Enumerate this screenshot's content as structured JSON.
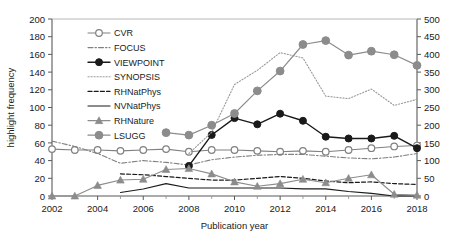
{
  "chart_data": {
    "type": "line",
    "title": "",
    "xlabel": "Publication year",
    "ylabel": "highlight frequency",
    "y2label": "",
    "xlim": [
      2002,
      2018
    ],
    "ylim": [
      0,
      200
    ],
    "y2lim": [
      0,
      500
    ],
    "grid": false,
    "legend_position": "inside-top-left",
    "xticks": [
      "2002",
      "2004",
      "2006",
      "2008",
      "2010",
      "2012",
      "2014",
      "2016",
      "2018"
    ],
    "yticks": [
      "0",
      "20",
      "40",
      "60",
      "80",
      "100",
      "120",
      "140",
      "160",
      "180",
      "200"
    ],
    "y2ticks": [
      "0",
      "50",
      "100",
      "150",
      "200",
      "250",
      "300",
      "350",
      "400",
      "450",
      "500"
    ],
    "x": [
      2002,
      2003,
      2004,
      2005,
      2006,
      2007,
      2008,
      2009,
      2010,
      2011,
      2012,
      2013,
      2014,
      2015,
      2016,
      2017,
      2018
    ],
    "series": [
      {
        "name": "CVR",
        "axis": "left",
        "style": "solid-open-circle",
        "color": "#808080",
        "values": [
          53,
          52,
          52,
          51,
          52,
          53,
          50,
          52,
          52,
          51,
          50,
          51,
          50,
          52,
          54,
          56,
          57
        ]
      },
      {
        "name": "FOCUS",
        "axis": "left",
        "style": "dash-dot",
        "color": "#808080",
        "values": [
          62,
          56,
          48,
          37,
          40,
          38,
          35,
          41,
          44,
          46,
          47,
          47,
          45,
          43,
          42,
          44,
          48
        ]
      },
      {
        "name": "VIEWPOINT",
        "axis": "left",
        "style": "solid-filled-circle",
        "color": "#1a1a1a",
        "values": [
          null,
          null,
          null,
          null,
          null,
          null,
          34,
          69,
          88,
          81,
          93,
          85,
          67,
          65,
          65,
          68,
          54
        ]
      },
      {
        "name": "SYNOPSIS",
        "axis": "right",
        "style": "dotted",
        "color": "#9a9a9a",
        "values": [
          null,
          null,
          null,
          null,
          null,
          null,
          120,
          180,
          315,
          355,
          405,
          390,
          282,
          275,
          302,
          256,
          273
        ]
      },
      {
        "name": "RHNatPhys",
        "axis": "left",
        "style": "dashed",
        "color": "#1a1a1a",
        "values": [
          null,
          null,
          null,
          25,
          24,
          22,
          20,
          18,
          18,
          20,
          22,
          20,
          17,
          15,
          16,
          14,
          13
        ]
      },
      {
        "name": "NVNatPhys",
        "axis": "left",
        "style": "solid-thin",
        "color": "#1a1a1a",
        "values": [
          null,
          null,
          null,
          4,
          8,
          14,
          9,
          9,
          9,
          9,
          9,
          8,
          8,
          5,
          3,
          0,
          0
        ]
      },
      {
        "name": "RHNature",
        "axis": "left",
        "style": "solid-triangle",
        "color": "#8c8c8c",
        "values": [
          0,
          0,
          12,
          18,
          19,
          30,
          31,
          25,
          16,
          11,
          14,
          19,
          15,
          20,
          24,
          2,
          1
        ]
      },
      {
        "name": "LSUGG",
        "axis": "right",
        "style": "solid-filled-circle-gray",
        "color": "#8c8c8c",
        "values": [
          null,
          null,
          null,
          null,
          null,
          179,
          172,
          200,
          233,
          297,
          353,
          428,
          439,
          398,
          409,
          399,
          369
        ]
      }
    ]
  },
  "legend": {
    "items": [
      {
        "label": "CVR"
      },
      {
        "label": "FOCUS"
      },
      {
        "label": "VIEWPOINT"
      },
      {
        "label": "SYNOPSIS"
      },
      {
        "label": "RHNatPhys"
      },
      {
        "label": "NVNatPhys"
      },
      {
        "label": "RHNature"
      },
      {
        "label": "LSUGG"
      }
    ]
  }
}
